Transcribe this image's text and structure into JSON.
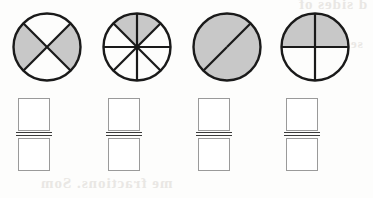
{
  "worksheet": {
    "title": "Fraction shading worksheet",
    "background_color": "#fdfdfc",
    "shade_color": "#c8c8c8",
    "outline_color": "#1a1a1a",
    "box_outline_color": "#9a9a9a",
    "fraction_bar_color": "#3a3a3a",
    "artifacts": [
      {
        "name": "bleed-top-right",
        "text": "d sides of"
      },
      {
        "name": "bleed-mid-right",
        "text": "se"
      },
      {
        "name": "bleed-bottom",
        "text": "me fractions. Som"
      }
    ]
  },
  "problems": [
    {
      "id": "problem-1",
      "x": 5,
      "circle": {
        "name": "fraction-circle-diagonal-quarters",
        "total_parts": 4,
        "shaded_parts": 2,
        "fraction": "2/4",
        "division_style": "diagonal-cross",
        "cut_angles_deg": [
          45,
          135,
          225,
          315
        ],
        "shaded_sectors": [
          {
            "start_deg": 315,
            "end_deg": 45
          },
          {
            "start_deg": 135,
            "end_deg": 225
          }
        ]
      },
      "answer": {
        "numerator": "",
        "denominator": "",
        "placeholder": ""
      }
    },
    {
      "id": "problem-2",
      "x": 95,
      "circle": {
        "name": "fraction-circle-eighths",
        "total_parts": 8,
        "shaded_parts": 2,
        "fraction": "2/8",
        "division_style": "eighths",
        "cut_angles_deg": [
          0,
          45,
          90,
          135,
          180,
          225,
          270,
          315
        ],
        "shaded_sectors": [
          {
            "start_deg": 45,
            "end_deg": 90
          },
          {
            "start_deg": 90,
            "end_deg": 135
          }
        ]
      },
      "answer": {
        "numerator": "",
        "denominator": "",
        "placeholder": ""
      }
    },
    {
      "id": "problem-3",
      "x": 185,
      "circle": {
        "name": "fraction-circle-diagonal-halves",
        "total_parts": 2,
        "shaded_parts": 2,
        "fraction": "2/2",
        "division_style": "single-diagonal",
        "cut_angles_deg": [
          45,
          225
        ],
        "shaded_sectors": [
          {
            "start_deg": 45,
            "end_deg": 225
          },
          {
            "start_deg": 225,
            "end_deg": 45
          }
        ]
      },
      "answer": {
        "numerator": "",
        "denominator": "",
        "placeholder": ""
      }
    },
    {
      "id": "problem-4",
      "x": 273,
      "circle": {
        "name": "fraction-circle-quarters",
        "total_parts": 4,
        "shaded_parts": 2,
        "fraction": "2/4",
        "division_style": "cross-quarters",
        "cut_angles_deg": [
          0,
          90,
          180,
          270
        ],
        "shaded_sectors": [
          {
            "start_deg": 0,
            "end_deg": 90
          },
          {
            "start_deg": 90,
            "end_deg": 180
          }
        ]
      },
      "answer": {
        "numerator": "",
        "denominator": "",
        "placeholder": ""
      }
    }
  ]
}
